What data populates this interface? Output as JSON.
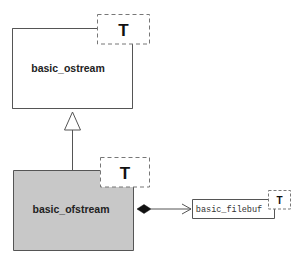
{
  "diagram": {
    "type": "uml-class-diagram",
    "classes": [
      {
        "id": "basic_ostream",
        "name": "basic_ostream",
        "template_param": "T",
        "highlighted": false,
        "fill": "#ffffff"
      },
      {
        "id": "basic_ofstream",
        "name": "basic_ofstream",
        "template_param": "T",
        "highlighted": true,
        "fill": "#c8c8c8"
      },
      {
        "id": "basic_filebuf",
        "name": "basic_filebuf",
        "template_param": "T",
        "highlighted": false,
        "fill": "#ffffff"
      }
    ],
    "relationships": [
      {
        "type": "inheritance",
        "from": "basic_ofstream",
        "to": "basic_ostream"
      },
      {
        "type": "composition",
        "from": "basic_ofstream",
        "to": "basic_filebuf"
      }
    ],
    "colors": {
      "stroke": "#555555",
      "highlight_fill": "#c8c8c8",
      "dashed_stroke": "#777777"
    }
  }
}
